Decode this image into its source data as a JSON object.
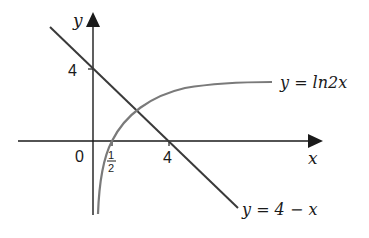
{
  "diagram": {
    "axes": {
      "x_label": "x",
      "y_label": "y",
      "origin_label": "0",
      "x_ticks": [
        {
          "value": 0.5,
          "label_num": "1",
          "label_den": "2"
        },
        {
          "value": 4,
          "label": "4"
        }
      ],
      "y_ticks": [
        {
          "value": 4,
          "label": "4"
        }
      ]
    },
    "curves": [
      {
        "name": "line",
        "equation_label": "y = 4 − x",
        "color": "#3a3a3a"
      },
      {
        "name": "log-curve",
        "equation_label": "y = ln2x",
        "color": "#7a7a7a"
      }
    ],
    "colors": {
      "axis": "#1a1a1a",
      "line": "#3a3a3a",
      "curve": "#7a7a7a",
      "background": "#ffffff"
    }
  }
}
